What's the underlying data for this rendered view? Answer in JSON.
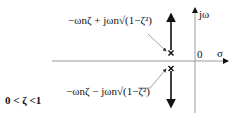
{
  "diagram": {
    "type": "s-plane pole locations",
    "axes": {
      "real_label": "σ",
      "imag_label": "jω",
      "origin_label": "0"
    },
    "poles": [
      {
        "id": "upper",
        "label": "−ωnζ + jωn√(1−ζ²)",
        "marker": "x"
      },
      {
        "id": "lower",
        "label": "−ωnζ − jωn√(1−ζ²)",
        "marker": "x"
      }
    ],
    "condition": "0 < ζ <1",
    "colors": {
      "axis": "#9a9a9a",
      "locus": "#111111",
      "pointer": "#8a8a8a",
      "text": "#111111"
    }
  }
}
